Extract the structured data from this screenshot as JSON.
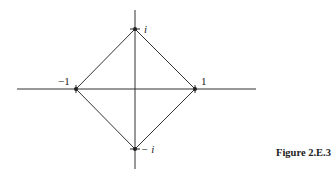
{
  "figure": {
    "caption": "Figure 2.E.3",
    "points": [
      {
        "name": "i",
        "label": "i",
        "re": 0,
        "im": 1
      },
      {
        "name": "minus-one",
        "label": "−1",
        "re": -1,
        "im": 0
      },
      {
        "name": "one",
        "label": "1",
        "re": 1,
        "im": 0
      },
      {
        "name": "minus-i",
        "label": "− i",
        "re": 0,
        "im": -1
      }
    ]
  }
}
